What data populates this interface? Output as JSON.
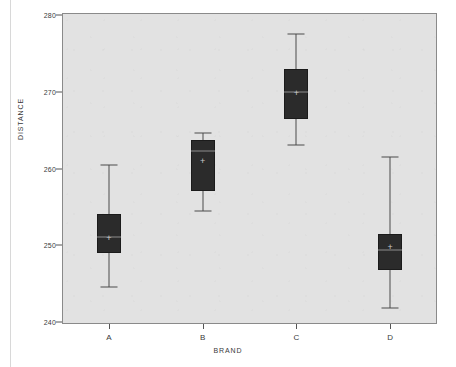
{
  "figure": {
    "panel_bg_color": "#e2e2e2",
    "panel_border_color": "#8a8a8a",
    "box_fill_color": "#2b2b2b",
    "whisker_color": "#4a4a4a",
    "median_color": "#8d8d8d",
    "mean_marker_glyph": "+"
  },
  "chart_data": {
    "type": "box",
    "title": "",
    "xlabel": "BRAND",
    "ylabel": "DISTANCE",
    "categories": [
      "A",
      "B",
      "C",
      "D"
    ],
    "ylim": [
      238,
      280.5
    ],
    "yticks": [
      240,
      250,
      260,
      270,
      280
    ],
    "ytick_labels": [
      "240",
      "250",
      "260",
      "270",
      "280"
    ],
    "grid": false,
    "legend": null,
    "boxes": [
      {
        "category": "A",
        "whisker_low": 244.5,
        "q1": 249.0,
        "median": 251.1,
        "mean": 251.0,
        "q3": 254.1,
        "whisker_high": 260.5
      },
      {
        "category": "B",
        "whisker_low": 254.5,
        "q1": 257.1,
        "median": 262.3,
        "mean": 261.0,
        "q3": 263.7,
        "whisker_high": 264.6
      },
      {
        "category": "C",
        "whisker_low": 263.0,
        "q1": 266.5,
        "median": 270.0,
        "mean": 269.8,
        "q3": 272.9,
        "whisker_high": 277.5
      },
      {
        "category": "D",
        "whisker_low": 241.8,
        "q1": 246.8,
        "median": 249.4,
        "mean": 249.8,
        "q3": 251.5,
        "whisker_high": 261.5
      }
    ]
  }
}
